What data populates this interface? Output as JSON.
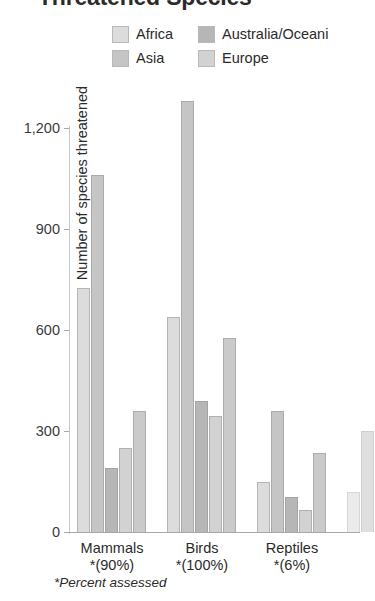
{
  "title": "Threatened Species",
  "legend": {
    "items": [
      {
        "label": "Africa",
        "color": "#dcdcdc"
      },
      {
        "label": "Australia/Oceani",
        "color": "#b6b6b6"
      },
      {
        "label": "Asia",
        "color": "#c5c5c5"
      },
      {
        "label": "Europe",
        "color": "#d2d2d2"
      }
    ]
  },
  "footnote": "*Percent assessed",
  "chart_data": {
    "type": "bar",
    "title": "Threatened Species",
    "xlabel": "",
    "ylabel": "Number of species threatened",
    "ylim": [
      0,
      1200
    ],
    "yticks": [
      "0",
      "300",
      "600",
      "900",
      "1,200"
    ],
    "ytick_values": [
      0,
      300,
      600,
      900,
      1200
    ],
    "grid": false,
    "legend_position": "top",
    "categories": [
      "Mammals\n*(90%)",
      "Birds\n*(100%)",
      "Reptiles\n*(6%)"
    ],
    "category_labels": [
      {
        "name": "Mammals",
        "percent": "*(90%)"
      },
      {
        "name": "Birds",
        "percent": "*(100%)"
      },
      {
        "name": "Reptiles",
        "percent": "*(6%)"
      }
    ],
    "series": [
      {
        "name": "Africa",
        "color": "#dcdcdc",
        "values": [
          725,
          640,
          150
        ]
      },
      {
        "name": "Asia",
        "color": "#c5c5c5",
        "values": [
          1060,
          1280,
          360
        ]
      },
      {
        "name": "Australia/Oceani",
        "color": "#b6b6b6",
        "values": [
          190,
          390,
          105
        ]
      },
      {
        "name": "Europe",
        "color": "#d2d2d2",
        "values": [
          250,
          345,
          65
        ]
      },
      {
        "name": "",
        "color": "#cacaca",
        "values": [
          360,
          575,
          235
        ]
      }
    ],
    "note": "Title and legend label 'Australia/Oceania' are clipped at image edges; a fifth bar per group and a fourth category are partially cut off at the right edge."
  }
}
